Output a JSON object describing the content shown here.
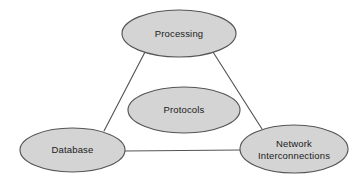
{
  "diagram": {
    "background_color": "#ffffff",
    "node_fill_color": "#d4d4d4",
    "node_stroke_color": "#555555",
    "edge_stroke_color": "#555555",
    "label_text_color": "#1a1a1a",
    "nodes": [
      {
        "id": "processing",
        "label": "Processing",
        "lines": [
          "Processing"
        ],
        "cx": 179,
        "cy": 33.5,
        "rx": 57,
        "ry": 23.5
      },
      {
        "id": "protocols",
        "label": "Protocols",
        "lines": [
          "Protocols"
        ],
        "cx": 184,
        "cy": 110,
        "rx": 56,
        "ry": 23
      },
      {
        "id": "database",
        "label": "Database",
        "lines": [
          "Database"
        ],
        "cx": 72.5,
        "cy": 150,
        "rx": 52.5,
        "ry": 22
      },
      {
        "id": "network-interconnections",
        "label": "Network Interconnections",
        "lines": [
          "Network",
          "Interconnections"
        ],
        "cx": 294,
        "cy": 149,
        "rx": 54,
        "ry": 24
      }
    ],
    "edges": [
      {
        "id": "processing-database",
        "from": "processing",
        "to": "database",
        "x1": 145,
        "y1": 52,
        "x2": 104,
        "y2": 131
      },
      {
        "id": "processing-network",
        "from": "processing",
        "to": "network-interconnections",
        "x1": 213,
        "y1": 52,
        "x2": 262,
        "y2": 129
      },
      {
        "id": "database-network",
        "from": "database",
        "to": "network-interconnections",
        "x1": 124,
        "y1": 151,
        "x2": 241,
        "y2": 150
      }
    ]
  }
}
